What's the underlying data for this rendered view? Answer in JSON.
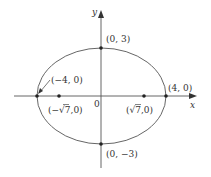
{
  "diagram": {
    "type": "ellipse-graph",
    "equation_semantics": "x^2/16 + y^2/9 = 1",
    "colors": {
      "stroke": "#555555",
      "text": "#333333",
      "background": "#ffffff"
    },
    "axes": {
      "x_label": "x",
      "y_label": "y",
      "origin_label": "0"
    },
    "points": {
      "top_vertex": "(0, 3)",
      "bottom_vertex": "(0, −3)",
      "left_vertex": "(−4, 0)",
      "right_vertex": "(4, 0)",
      "left_focus_prefix": "(−",
      "left_focus_sqrt": "√7",
      "left_focus_suffix": ",0)",
      "right_focus_prefix": "(",
      "right_focus_sqrt": "√7",
      "right_focus_suffix": ",0)"
    }
  }
}
